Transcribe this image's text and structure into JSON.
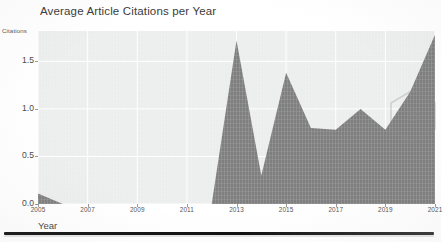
{
  "chart_data": {
    "type": "area",
    "title": "Average Article Citations per Year",
    "xlabel": "Year",
    "ylabel": "Citations",
    "xlim": [
      2005,
      2021
    ],
    "ylim": [
      0.0,
      1.82
    ],
    "grid": true,
    "legend": null,
    "x": [
      2005,
      2006,
      2007,
      2008,
      2009,
      2010,
      2011,
      2012,
      2013,
      2014,
      2015,
      2016,
      2017,
      2018,
      2019,
      2020,
      2021
    ],
    "values": [
      0.11,
      0.0,
      0.0,
      0.0,
      0.0,
      0.0,
      0.0,
      0.0,
      1.72,
      0.3,
      1.38,
      0.8,
      0.78,
      1.0,
      0.78,
      1.18,
      1.78
    ],
    "series": [
      {
        "name": "Citations",
        "values": [
          0.11,
          0.0,
          0.0,
          0.0,
          0.0,
          0.0,
          0.0,
          0.0,
          1.72,
          0.3,
          1.38,
          0.8,
          0.78,
          1.0,
          0.78,
          1.18,
          1.78
        ]
      }
    ],
    "xticks": [
      2005,
      2007,
      2009,
      2011,
      2013,
      2015,
      2017,
      2019,
      2021
    ],
    "xtick_labels": [
      "2005",
      "2007",
      "2009",
      "2011",
      "2013",
      "2015",
      "2017",
      "2019",
      "2021"
    ],
    "yticks": [
      0.0,
      0.5,
      1.0,
      1.5
    ],
    "ytick_labels": [
      "0.0",
      "0.5",
      "1.0",
      "1.5"
    ],
    "colors": {
      "area_fill": "#7f7f7f",
      "plot_background": "#eceded",
      "grid_line": "#ffffff",
      "tick_text": "#4a4a4a",
      "title_text": "#3b3b3b",
      "page_background": "#ffffff"
    }
  },
  "watermark": {
    "shape": "hexagon",
    "glyph": "B"
  }
}
